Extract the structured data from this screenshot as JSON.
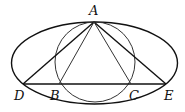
{
  "diagram": {
    "points": {
      "A": {
        "label": "A",
        "x": 94,
        "y": 22,
        "lx": 89,
        "ly": 15
      },
      "B": {
        "label": "B",
        "x": 59,
        "y": 84,
        "lx": 50,
        "ly": 100
      },
      "C": {
        "label": "C",
        "x": 131,
        "y": 84,
        "lx": 129,
        "ly": 100
      },
      "D": {
        "label": "D",
        "x": 23,
        "y": 84,
        "lx": 14,
        "ly": 100
      },
      "E": {
        "label": "E",
        "x": 166,
        "y": 84,
        "lx": 164,
        "ly": 100
      }
    },
    "ellipse": {
      "cx": 94.5,
      "cy": 63,
      "rx": 83,
      "ry": 41
    },
    "circle": {
      "cx": 95,
      "cy": 62,
      "r": 40
    },
    "segments": [
      "AD",
      "AE",
      "AB",
      "AC",
      "DE"
    ],
    "stroke_color": "#111111"
  }
}
